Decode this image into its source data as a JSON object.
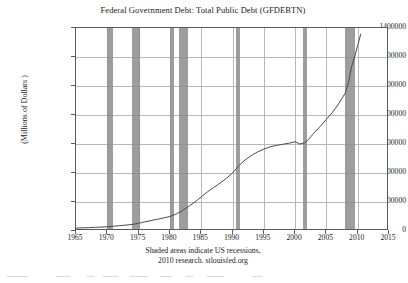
{
  "chart_data": {
    "type": "line",
    "title": "Federal Government Debt: Total Public Debt (GFDEBTN)",
    "xlabel": "",
    "ylabel": "(Millions of Dollars )",
    "xlim": [
      1965,
      2015
    ],
    "ylim": [
      0,
      1400000
    ],
    "grid": true,
    "legend": null,
    "xticks": [
      "1965",
      "1970",
      "1975",
      "1980",
      "1985",
      "1990",
      "1995",
      "2000",
      "2005",
      "2010",
      "2015"
    ],
    "yticks": [
      "0",
      "200000",
      "400000",
      "600000",
      "800000",
      "1000000",
      "1200000",
      "1400000"
    ],
    "series": [
      {
        "name": "GFDEBTN",
        "color": "#4a4a4a",
        "x": [
          1965,
          1966,
          1967,
          1968,
          1969,
          1970,
          1971,
          1972,
          1973,
          1974,
          1975,
          1976,
          1977,
          1978,
          1979,
          1980,
          1981,
          1982,
          1983,
          1984,
          1985,
          1986,
          1987,
          1988,
          1989,
          1990,
          1991,
          1992,
          1993,
          1994,
          1995,
          1996,
          1997,
          1998,
          1999,
          2000,
          2000.75,
          2001.5,
          2002,
          2003,
          2004,
          2005,
          2006,
          2007,
          2008,
          2008.6,
          2009,
          2009.5,
          2010,
          2010.5
        ],
        "y": [
          20000,
          21500,
          23000,
          25000,
          27000,
          29000,
          33000,
          37000,
          41000,
          45000,
          53000,
          63000,
          72000,
          81000,
          90000,
          100000,
          117000,
          140000,
          170000,
          200000,
          235000,
          270000,
          300000,
          330000,
          362000,
          400000,
          450000,
          490000,
          520000,
          545000,
          565000,
          580000,
          590000,
          598000,
          605000,
          616000,
          600000,
          608000,
          625000,
          675000,
          720000,
          770000,
          820000,
          880000,
          950000,
          1040000,
          1130000,
          1200000,
          1280000,
          1360000
        ]
      }
    ],
    "recessions": [
      {
        "start": 1969.92,
        "end": 1970.92
      },
      {
        "start": 1973.92,
        "end": 1975.25
      },
      {
        "start": 1980.0,
        "end": 1980.58
      },
      {
        "start": 1981.5,
        "end": 1982.92
      },
      {
        "start": 1990.5,
        "end": 1991.25
      },
      {
        "start": 2001.25,
        "end": 2001.92
      },
      {
        "start": 2007.92,
        "end": 2009.5
      }
    ],
    "recession_color": "#8c8c8c",
    "annotations": [
      "Shaded areas indicate US recessions,",
      "2010 research. stlouisfed.org"
    ]
  },
  "footnote": {
    "line1": "Shaded areas indicate US recessions,",
    "line2": "2010 research. stlouisfed.org"
  }
}
